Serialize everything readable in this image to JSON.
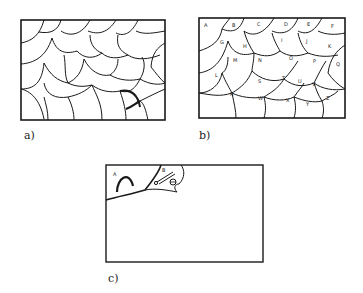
{
  "figure": {
    "panels": [
      {
        "id": "a",
        "caption": "a)",
        "description": "Rectangular frame filled with irregular scale-like cells (tessellation), unlabeled"
      },
      {
        "id": "b",
        "caption": "b)",
        "description": "Same tessellation with each cell labeled by a letter",
        "cell_labels": [
          "A",
          "B",
          "C",
          "D",
          "E",
          "F",
          "G",
          "H",
          "I",
          "J",
          "K",
          "L",
          "M",
          "N",
          "O",
          "P",
          "Q",
          "R",
          "S",
          "T",
          "U",
          "V",
          "W",
          "X",
          "Y",
          "Z"
        ]
      },
      {
        "id": "c",
        "caption": "c)",
        "description": "Empty frame with two cells drawn in top-left corner containing sketches",
        "cell_labels": [
          "A",
          "B"
        ],
        "cell_contents": {
          "A": "arch / curved stroke",
          "B": "small tool and round object"
        }
      }
    ]
  },
  "colors": {
    "ink": "#1a1a1a",
    "background": "#ffffff"
  }
}
